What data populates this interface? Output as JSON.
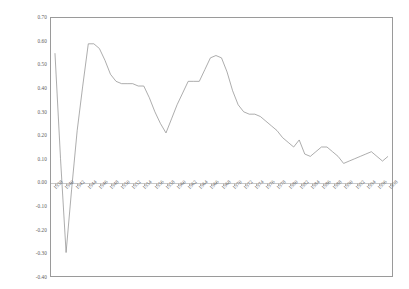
{
  "chart_data": {
    "type": "line",
    "title": "",
    "xlabel": "",
    "ylabel": "",
    "ylim": [
      -0.4,
      0.7
    ],
    "ytick_labels": [
      "0.70",
      "0.60",
      "0.50",
      "0.40",
      "0.30",
      "0.20",
      "0.10",
      "0.00",
      "-0.10",
      "-0.20",
      "-0.30",
      "-0.40"
    ],
    "ytick_values": [
      0.7,
      0.6,
      0.5,
      0.4,
      0.3,
      0.2,
      0.1,
      0.0,
      -0.1,
      -0.2,
      -0.3,
      -0.4
    ],
    "grid": false,
    "legend": "none",
    "xtick_labels": [
      "1938",
      "1940",
      "1942",
      "1944",
      "1946",
      "1948",
      "1950",
      "1952",
      "1954",
      "1956",
      "1958",
      "1960",
      "1962",
      "1964",
      "1966",
      "1968",
      "1970",
      "1972",
      "1974",
      "1976",
      "1978",
      "1980",
      "1982",
      "1984",
      "1986",
      "1988",
      "1990",
      "1992",
      "1994",
      "1996",
      "1998"
    ],
    "x": [
      1938,
      1939,
      1940,
      1941,
      1942,
      1943,
      1944,
      1945,
      1946,
      1947,
      1948,
      1949,
      1950,
      1951,
      1952,
      1953,
      1954,
      1955,
      1956,
      1957,
      1958,
      1959,
      1960,
      1961,
      1962,
      1963,
      1964,
      1965,
      1966,
      1967,
      1968,
      1969,
      1970,
      1971,
      1972,
      1973,
      1974,
      1975,
      1976,
      1977,
      1978,
      1979,
      1980,
      1981,
      1982,
      1983,
      1984,
      1985,
      1986,
      1987,
      1988,
      1989,
      1990,
      1991,
      1992,
      1993,
      1994,
      1995,
      1996,
      1997,
      1998
    ],
    "values": [
      0.55,
      0.1,
      -0.3,
      -0.03,
      0.22,
      0.41,
      0.59,
      0.59,
      0.57,
      0.52,
      0.46,
      0.43,
      0.42,
      0.42,
      0.42,
      0.41,
      0.41,
      0.36,
      0.3,
      0.25,
      0.21,
      0.27,
      0.33,
      0.38,
      0.43,
      0.43,
      0.43,
      0.48,
      0.53,
      0.54,
      0.53,
      0.47,
      0.39,
      0.33,
      0.3,
      0.29,
      0.29,
      0.28,
      0.26,
      0.24,
      0.22,
      0.19,
      0.17,
      0.15,
      0.18,
      0.12,
      0.11,
      0.13,
      0.15,
      0.15,
      0.13,
      0.11,
      0.08,
      0.09,
      0.1,
      0.11,
      0.12,
      0.13,
      0.11,
      0.09,
      0.11
    ],
    "line_color": "#8a8a8a",
    "axis_color": "#9a9a9a",
    "zero_line_color": "#c9c9c9"
  }
}
